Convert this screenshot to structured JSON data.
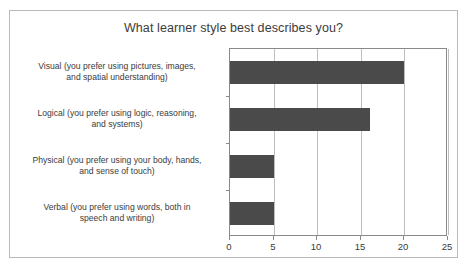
{
  "chart_data": {
    "type": "bar",
    "orientation": "horizontal",
    "title": "What learner style best describes you?",
    "xlabel": "",
    "ylabel": "",
    "categories": [
      "Visual (you prefer using pictures, images, and spatial understanding)",
      "Logical (you prefer using logic, reasoning, and systems)",
      "Physical (you prefer using your body, hands, and sense of touch)",
      "Verbal (you prefer using words, both in speech and writing)"
    ],
    "category_lines": [
      [
        "Visual (you prefer using pictures, images,",
        "and spatial understanding)"
      ],
      [
        "Logical (you prefer using logic, reasoning,",
        "and systems)"
      ],
      [
        "Physical (you prefer using your body, hands,",
        "and sense of touch)"
      ],
      [
        "Verbal (you prefer using words, both in",
        "speech and writing)"
      ]
    ],
    "values": [
      20,
      16,
      5,
      5
    ],
    "xlim": [
      0,
      25
    ],
    "xticks": [
      0,
      5,
      10,
      15,
      20,
      25
    ],
    "xtick_labels": [
      "0",
      "5",
      "10",
      "15",
      "20",
      "25"
    ],
    "grid": "vertical",
    "legend": "none",
    "bar_color": "#4a4a4a",
    "grid_color": "#bdbdbd",
    "axis_color": "#8a8a8a",
    "frame_color": "#b9b9b9",
    "text_color": "#3b3b3b",
    "background": "#ffffff"
  }
}
